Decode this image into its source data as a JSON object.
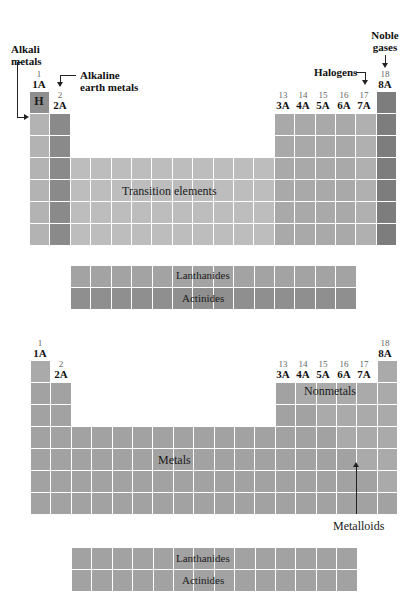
{
  "colors": {
    "hydrogen": "#8f8f8f",
    "alkali": "#b3b3b3",
    "alkaline_earth": "#8a8a8a",
    "transition": "#bdbdbd",
    "main_group": "#a9a9a9",
    "halogen": "#b0b0b0",
    "noble": "#7d7d7d",
    "inner_top": "#a3a3a3",
    "inner_bottom": "#8f8f8f",
    "bottom_table": "#a2a2a2",
    "nonmetal_region": "#aaaaaa"
  },
  "top_table": {
    "labels": {
      "alkali_metals": "Alkali metals",
      "alkali_line1": "Alkali",
      "alkali_line2": "metals",
      "alkaline_earth_line1": "Alkaline",
      "alkaline_earth_line2": "earth metals",
      "halogens": "Halogens",
      "noble_line1": "Noble",
      "noble_line2": "gases",
      "transition_elements": "Transition elements",
      "hydrogen_symbol": "H",
      "lanthanides": "Lanthanides",
      "actinides": "Actinides"
    },
    "groups": {
      "g1_num": "1",
      "g1_lab": "1A",
      "g2_num": "2",
      "g2_lab": "2A",
      "g13_num": "13",
      "g13_lab": "3A",
      "g14_num": "14",
      "g14_lab": "4A",
      "g15_num": "15",
      "g15_lab": "5A",
      "g16_num": "16",
      "g16_lab": "6A",
      "g17_num": "17",
      "g17_lab": "7A",
      "g18_num": "18",
      "g18_lab": "8A",
      "transition_nums": [
        "3",
        "4",
        "5",
        "6",
        "7",
        "8",
        "9",
        "10",
        "11",
        "12"
      ]
    }
  },
  "bottom_table": {
    "labels": {
      "nonmetals": "Nonmetals",
      "metals": "Metals",
      "metalloids": "Metalloids",
      "lanthanides": "Lanthanides",
      "actinides": "Actinides"
    },
    "groups": {
      "g1_num": "1",
      "g1_lab": "1A",
      "g2_num": "2",
      "g2_lab": "2A",
      "g13_num": "13",
      "g13_lab": "3A",
      "g14_num": "14",
      "g14_lab": "4A",
      "g15_num": "15",
      "g15_lab": "5A",
      "g16_num": "16",
      "g16_lab": "6A",
      "g17_num": "17",
      "g17_lab": "7A",
      "g18_num": "18",
      "g18_lab": "8A",
      "transition_nums": [
        "3",
        "4",
        "5",
        "6",
        "7",
        "8",
        "9",
        "10",
        "11",
        "12"
      ]
    }
  }
}
